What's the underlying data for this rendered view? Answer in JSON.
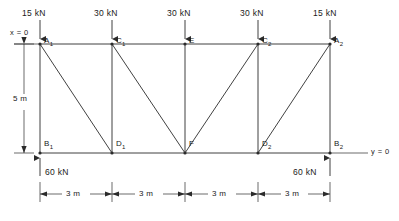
{
  "figure": {
    "type": "truss-free-body-diagram",
    "units": "kN / m",
    "geometry": {
      "span_m": 12,
      "height_m": 5,
      "bay_width_m": 3,
      "top_chord_y_m": 5,
      "bottom_chord_y_m": 0
    },
    "axis_labels": {
      "x_origin": "x = 0",
      "y_origin": "y = 0"
    },
    "nodes": [
      {
        "id": "A1",
        "label": "A",
        "sub": "1",
        "x_m": 0,
        "y_m": 5,
        "chord": "top"
      },
      {
        "id": "C1",
        "label": "C",
        "sub": "1",
        "x_m": 3,
        "y_m": 5,
        "chord": "top"
      },
      {
        "id": "E",
        "label": "E",
        "sub": "",
        "x_m": 6,
        "y_m": 5,
        "chord": "top"
      },
      {
        "id": "C2",
        "label": "C",
        "sub": "2",
        "x_m": 9,
        "y_m": 5,
        "chord": "top"
      },
      {
        "id": "A2",
        "label": "A",
        "sub": "2",
        "x_m": 12,
        "y_m": 5,
        "chord": "top"
      },
      {
        "id": "B1",
        "label": "B",
        "sub": "1",
        "x_m": 0,
        "y_m": 0,
        "chord": "bottom"
      },
      {
        "id": "D1",
        "label": "D",
        "sub": "1",
        "x_m": 3,
        "y_m": 0,
        "chord": "bottom"
      },
      {
        "id": "F",
        "label": "F",
        "sub": "",
        "x_m": 6,
        "y_m": 0,
        "chord": "bottom"
      },
      {
        "id": "D2",
        "label": "D",
        "sub": "2",
        "x_m": 9,
        "y_m": 0,
        "chord": "bottom"
      },
      {
        "id": "B2",
        "label": "B",
        "sub": "2",
        "x_m": 12,
        "y_m": 0,
        "chord": "bottom"
      }
    ],
    "members": [
      {
        "from": "A1",
        "to": "C1",
        "kind": "top-chord"
      },
      {
        "from": "C1",
        "to": "E",
        "kind": "top-chord"
      },
      {
        "from": "E",
        "to": "C2",
        "kind": "top-chord"
      },
      {
        "from": "C2",
        "to": "A2",
        "kind": "top-chord"
      },
      {
        "from": "B1",
        "to": "D1",
        "kind": "bottom-chord"
      },
      {
        "from": "D1",
        "to": "F",
        "kind": "bottom-chord"
      },
      {
        "from": "F",
        "to": "D2",
        "kind": "bottom-chord"
      },
      {
        "from": "D2",
        "to": "B2",
        "kind": "bottom-chord"
      },
      {
        "from": "A1",
        "to": "B1",
        "kind": "vertical"
      },
      {
        "from": "C1",
        "to": "D1",
        "kind": "vertical"
      },
      {
        "from": "E",
        "to": "F",
        "kind": "vertical"
      },
      {
        "from": "C2",
        "to": "D2",
        "kind": "vertical"
      },
      {
        "from": "A2",
        "to": "B2",
        "kind": "vertical"
      },
      {
        "from": "A1",
        "to": "D1",
        "kind": "diagonal"
      },
      {
        "from": "C1",
        "to": "F",
        "kind": "diagonal"
      },
      {
        "from": "F",
        "to": "C2",
        "kind": "diagonal"
      },
      {
        "from": "D2",
        "to": "A2",
        "kind": "diagonal"
      }
    ],
    "loads": [
      {
        "at": "A1",
        "magnitude": "15 kN",
        "value": 15,
        "direction": "down"
      },
      {
        "at": "C1",
        "magnitude": "30 kN",
        "value": 30,
        "direction": "down"
      },
      {
        "at": "E",
        "magnitude": "30 kN",
        "value": 30,
        "direction": "down"
      },
      {
        "at": "C2",
        "magnitude": "30 kN",
        "value": 30,
        "direction": "down"
      },
      {
        "at": "A2",
        "magnitude": "15 kN",
        "value": 15,
        "direction": "down"
      }
    ],
    "reactions": [
      {
        "at": "B1",
        "magnitude": "60 kN",
        "value": 60,
        "direction": "up"
      },
      {
        "at": "B2",
        "magnitude": "60 kN",
        "value": 60,
        "direction": "up"
      }
    ],
    "dimensions": {
      "vertical": {
        "label": "5 m",
        "value": 5
      },
      "horizontal": [
        {
          "label": "3 m",
          "value": 3
        },
        {
          "label": "3 m",
          "value": 3
        },
        {
          "label": "3 m",
          "value": 3
        },
        {
          "label": "3 m",
          "value": 3
        }
      ]
    },
    "colors": {
      "line": "#2b2b2b",
      "text": "#1a1a1a",
      "background": "#ffffff"
    }
  }
}
